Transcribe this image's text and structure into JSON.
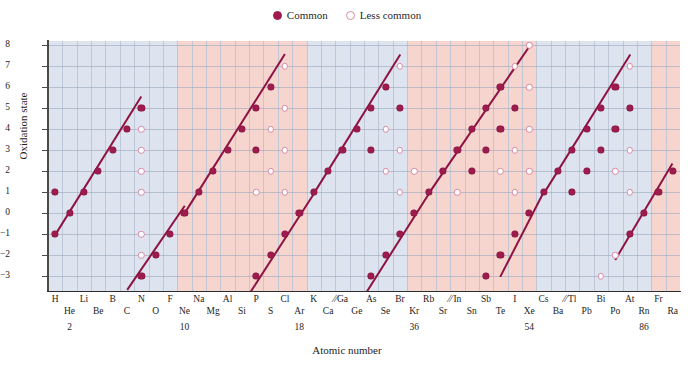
{
  "legend": {
    "common_label": "Common",
    "less_common_label": "Less common",
    "common_color": "#9e1b4d",
    "less_common_color": "#d98ba6"
  },
  "axes": {
    "ylabel": "Oxidation state",
    "xlabel": "Atomic number",
    "yticks": [
      8,
      7,
      6,
      5,
      4,
      3,
      2,
      1,
      0,
      -1,
      -2,
      -3
    ],
    "ytick_labels": [
      "8",
      "7",
      "6",
      "5",
      "4",
      "3",
      "2",
      "1",
      "0",
      "−1",
      "−2",
      "−3"
    ],
    "ylim": [
      -3.7,
      8.2
    ],
    "atomic_number_marks": [
      "2",
      "10",
      "18",
      "36",
      "54",
      "86"
    ]
  },
  "colors": {
    "band_blue": "#dde4ef",
    "band_pink": "#f6d5cf",
    "trend_line": "#8e1342",
    "grid": "#b9c3d4"
  },
  "element_labels_row1": [
    "H",
    "Li",
    "B",
    "N",
    "F",
    "Na",
    "Al",
    "P",
    "Cl",
    "K",
    "Ga",
    "As",
    "Br",
    "Rb",
    "In",
    "Sb",
    "I",
    "Cs",
    "Tl",
    "Bi",
    "At",
    "Fr"
  ],
  "element_labels_row2": [
    "He",
    "Be",
    "C",
    "O",
    "Ne",
    "Mg",
    "Si",
    "S",
    "Ar",
    "Ca",
    "Ge",
    "Se",
    "Kr",
    "Sr",
    "Sn",
    "Te",
    "Xe",
    "Ba",
    "Pb",
    "Po",
    "Rn",
    "Ra"
  ],
  "break_marks": [
    "//",
    "//",
    "//"
  ],
  "chart_data": {
    "type": "scatter",
    "title": "",
    "xlabel": "Atomic number",
    "ylabel": "Oxidation state",
    "ylim": [
      -3.7,
      8.2
    ],
    "grid": true,
    "legend_position": "top-center",
    "series": [
      {
        "name": "Common",
        "marker": "filled-circle",
        "color": "#9e1b4d"
      },
      {
        "name": "Less common",
        "marker": "open-circle",
        "color": "#d98ba6"
      }
    ],
    "band_shading": [
      {
        "from": "H",
        "to": "F",
        "color": "blue"
      },
      {
        "from": "Ne",
        "to": "Ar",
        "color": "pink"
      },
      {
        "from": "K",
        "to": "Br",
        "color": "blue"
      },
      {
        "from": "Kr",
        "to": "Xe",
        "color": "pink"
      },
      {
        "from": "Cs",
        "to": "Rn",
        "color": "blue"
      },
      {
        "from": "Fr",
        "to": "Ra",
        "color": "pink"
      }
    ],
    "elements": [
      {
        "symbol": "H",
        "common": [
          1,
          -1
        ],
        "less": []
      },
      {
        "symbol": "He",
        "common": [
          0
        ],
        "less": []
      },
      {
        "symbol": "Li",
        "common": [
          1
        ],
        "less": []
      },
      {
        "symbol": "Be",
        "common": [
          2
        ],
        "less": []
      },
      {
        "symbol": "B",
        "common": [
          3
        ],
        "less": []
      },
      {
        "symbol": "C",
        "common": [
          4,
          -4
        ],
        "less": []
      },
      {
        "symbol": "N",
        "common": [
          5,
          -3
        ],
        "less": [
          4,
          3,
          2,
          1,
          -1,
          -2
        ]
      },
      {
        "symbol": "O",
        "common": [
          -2
        ],
        "less": []
      },
      {
        "symbol": "F",
        "common": [
          -1
        ],
        "less": []
      },
      {
        "symbol": "Ne",
        "common": [
          0
        ],
        "less": []
      },
      {
        "symbol": "Na",
        "common": [
          1
        ],
        "less": []
      },
      {
        "symbol": "Mg",
        "common": [
          2
        ],
        "less": []
      },
      {
        "symbol": "Al",
        "common": [
          3
        ],
        "less": []
      },
      {
        "symbol": "Si",
        "common": [
          4,
          -4
        ],
        "less": []
      },
      {
        "symbol": "P",
        "common": [
          5,
          3,
          -3
        ],
        "less": [
          1
        ]
      },
      {
        "symbol": "S",
        "common": [
          6,
          -2
        ],
        "less": [
          4,
          2
        ]
      },
      {
        "symbol": "Cl",
        "common": [
          -1
        ],
        "less": [
          7,
          5,
          3,
          1
        ]
      },
      {
        "symbol": "Ar",
        "common": [
          0
        ],
        "less": []
      },
      {
        "symbol": "K",
        "common": [
          1
        ],
        "less": []
      },
      {
        "symbol": "Ca",
        "common": [
          2
        ],
        "less": []
      },
      {
        "symbol": "Ga",
        "common": [
          3
        ],
        "less": []
      },
      {
        "symbol": "Ge",
        "common": [
          4,
          -4
        ],
        "less": []
      },
      {
        "symbol": "As",
        "common": [
          5,
          3,
          -3
        ],
        "less": []
      },
      {
        "symbol": "Se",
        "common": [
          6,
          -2
        ],
        "less": [
          4,
          2
        ]
      },
      {
        "symbol": "Br",
        "common": [
          5,
          -1
        ],
        "less": [
          7,
          3,
          1
        ]
      },
      {
        "symbol": "Kr",
        "common": [
          0
        ],
        "less": [
          2
        ]
      },
      {
        "symbol": "Rb",
        "common": [
          1
        ],
        "less": []
      },
      {
        "symbol": "Sr",
        "common": [
          2
        ],
        "less": []
      },
      {
        "symbol": "In",
        "common": [
          3
        ],
        "less": [
          1
        ]
      },
      {
        "symbol": "Sn",
        "common": [
          4,
          2
        ],
        "less": []
      },
      {
        "symbol": "Sb",
        "common": [
          5,
          3,
          -3
        ],
        "less": []
      },
      {
        "symbol": "Te",
        "common": [
          6,
          4,
          -2
        ],
        "less": [
          2
        ]
      },
      {
        "symbol": "I",
        "common": [
          5,
          -1
        ],
        "less": [
          7,
          3,
          1
        ]
      },
      {
        "symbol": "Xe",
        "common": [
          0
        ],
        "less": [
          8,
          6,
          4,
          2
        ]
      },
      {
        "symbol": "Cs",
        "common": [
          1
        ],
        "less": []
      },
      {
        "symbol": "Ba",
        "common": [
          2
        ],
        "less": []
      },
      {
        "symbol": "Tl",
        "common": [
          3,
          1
        ],
        "less": []
      },
      {
        "symbol": "Pb",
        "common": [
          4,
          2
        ],
        "less": []
      },
      {
        "symbol": "Bi",
        "common": [
          5,
          3
        ],
        "less": [
          -3
        ]
      },
      {
        "symbol": "Po",
        "common": [
          6,
          4
        ],
        "less": [
          2,
          -2
        ]
      },
      {
        "symbol": "At",
        "common": [
          5,
          -1
        ],
        "less": [
          7,
          3,
          1
        ]
      },
      {
        "symbol": "Rn",
        "common": [
          0
        ],
        "less": []
      },
      {
        "symbol": "Fr",
        "common": [
          1
        ],
        "less": []
      },
      {
        "symbol": "Ra",
        "common": [
          2
        ],
        "less": []
      }
    ],
    "trend_lines": [
      {
        "label": "period-1-2-upper",
        "from_el": "H",
        "from_y": -1,
        "to_el": "N",
        "to_y": 5.6
      },
      {
        "label": "period-2-lower",
        "from_el": "C",
        "from_y": -3.6,
        "to_el": "Ne",
        "to_y": 0.4
      },
      {
        "label": "period-3-upper",
        "from_el": "Ne",
        "from_y": 0,
        "to_el": "Cl",
        "to_y": 7.6
      },
      {
        "label": "period-3-lower",
        "from_el": "Si",
        "from_y": -4.3,
        "to_el": "K",
        "to_y": 1
      },
      {
        "label": "period-4-upper",
        "from_el": "K",
        "from_y": 1,
        "to_el": "Br",
        "to_y": 7.6
      },
      {
        "label": "period-4-lower",
        "from_el": "Ge",
        "from_y": -4.4,
        "to_el": "Rb",
        "to_y": 1
      },
      {
        "label": "period-5-upper",
        "from_el": "Rb",
        "from_y": 1,
        "to_el": "Xe",
        "to_y": 8
      },
      {
        "label": "period-5-lower",
        "from_el": "Te",
        "from_y": -3.0,
        "to_el": "Cs",
        "to_y": 1
      },
      {
        "label": "period-6-upper",
        "from_el": "Cs",
        "from_y": 1,
        "to_el": "At",
        "to_y": 7.6
      },
      {
        "label": "period-6-lower",
        "from_el": "Po",
        "from_y": -2.2,
        "to_el": "Ra",
        "to_y": 2.4
      }
    ]
  }
}
